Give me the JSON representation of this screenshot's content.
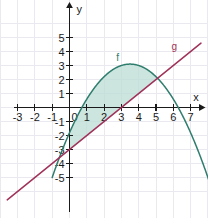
{
  "figure": {
    "background_color": "#ffffff",
    "grid_color": "#e9e9ef",
    "axis_color": "#1a1a1a",
    "x_axis_name": "x",
    "y_axis_name": "y"
  },
  "chart_data": {
    "type": "line",
    "title": "",
    "xlabel": "x",
    "ylabel": "y",
    "xlim": [
      -3.6,
      7.6
    ],
    "ylim": [
      -5.6,
      5.6
    ],
    "grid": true,
    "legend": "inline-curve-labels",
    "xticks": [
      -3,
      -2,
      -1,
      0,
      1,
      2,
      3,
      4,
      5,
      6,
      7
    ],
    "xtick_labels": [
      "-3",
      "-2",
      "-1",
      "0",
      "1",
      "2",
      "3",
      "4",
      "5",
      "6",
      "7"
    ],
    "yticks": [
      -5,
      -4,
      -3,
      -2,
      -1,
      1,
      2,
      3,
      4,
      5
    ],
    "ytick_labels": [
      "-5",
      "-4",
      "-3",
      "-2",
      "-1",
      "1",
      "2",
      "3",
      "4",
      "5"
    ],
    "series": [
      {
        "name": "f",
        "label": "f",
        "type": "parabola",
        "color": "#2e7d6d",
        "equation": "f(x) = -0.4x^2 + 2.8x - 1.8",
        "a": -0.4,
        "b": 2.8,
        "c": -1.8,
        "vertex": [
          3.5,
          3.1
        ],
        "roots": [
          0.8,
          6.2
        ],
        "label_position": [
          2.7,
          3.3
        ]
      },
      {
        "name": "g",
        "label": "g",
        "type": "line",
        "color": "#a0325a",
        "equation": "g(x) = x - 3",
        "slope": 1,
        "intercept": -3,
        "label_position": [
          5.9,
          4.1
        ]
      }
    ],
    "shaded_region": {
      "name": "area-between-f-and-g",
      "fill_color": "#bcdcd4",
      "opacity": 0.75,
      "upper_curve": "f",
      "lower_curve": "g",
      "x_start": 0,
      "x_end": 5
    },
    "intersections": [
      [
        0,
        -3
      ],
      [
        5,
        2
      ]
    ]
  }
}
